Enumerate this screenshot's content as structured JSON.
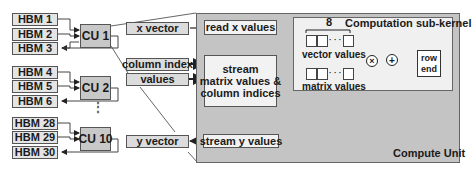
{
  "diagram": {
    "hbm_groups": [
      {
        "cu": "CU 1",
        "hbms": [
          "HBM 1",
          "HBM 2",
          "HBM 3"
        ]
      },
      {
        "cu": "CU 2",
        "hbms": [
          "HBM 4",
          "HBM 5",
          "HBM 6"
        ]
      },
      {
        "cu": "CU 10",
        "hbms": [
          "HBM 28",
          "HBM 29",
          "HBM 30"
        ]
      }
    ],
    "ellipsis": "⋮",
    "inputs": {
      "x_vector": "x vector",
      "column_index": "column index",
      "values": "values",
      "y_vector": "y vector"
    },
    "compute_unit": {
      "title": "Compute Unit",
      "read_x": "read x values",
      "stream_matrix": [
        "stream",
        "matrix values &",
        "column indices"
      ],
      "stream_y": "stream y values",
      "sub_kernel": {
        "title": "Computation sub-kernel",
        "width_label": "8",
        "vector_buffer": "vector values",
        "matrix_buffer": "matrix values",
        "multiply_op": "×",
        "add_op": "+",
        "row_end": [
          "row",
          "end"
        ],
        "ellipsis": "· · ·"
      }
    },
    "colors": {
      "compute_unit_bg": "#c4c4c4",
      "sub_kernel_bg": "#f0f0f0",
      "box_bg": "#dcdcdc",
      "line": "#222222",
      "gray_line": "#888888"
    }
  }
}
